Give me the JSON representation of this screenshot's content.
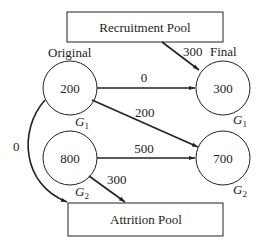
{
  "diagram": {
    "type": "flow-network",
    "pools": {
      "recruitment": {
        "label": "Recruitment Pool"
      },
      "attrition": {
        "label": "Attrition Pool"
      }
    },
    "column_headers": {
      "original": "Original",
      "final": "Final"
    },
    "nodes": {
      "orig_g1": {
        "value": "200",
        "group": "G",
        "subscript": "1"
      },
      "orig_g2": {
        "value": "800",
        "group": "G",
        "subscript": "2"
      },
      "final_g1": {
        "value": "300",
        "group": "G",
        "subscript": "1"
      },
      "final_g2": {
        "value": "700",
        "group": "G",
        "subscript": "2"
      }
    },
    "edges": [
      {
        "from": "Recruitment Pool",
        "to": "Final G1",
        "flow": "300"
      },
      {
        "from": "Original G1",
        "to": "Final G1",
        "flow": "0"
      },
      {
        "from": "Original G1",
        "to": "Final G2",
        "flow": "200"
      },
      {
        "from": "Original G1",
        "to": "Attrition Pool",
        "flow": "0"
      },
      {
        "from": "Original G2",
        "to": "Final G2",
        "flow": "500"
      },
      {
        "from": "Original G2",
        "to": "Attrition Pool",
        "flow": "300"
      }
    ],
    "colors": {
      "stroke": "#222222",
      "background": "#ffffff"
    }
  }
}
